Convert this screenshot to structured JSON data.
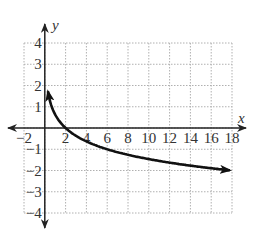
{
  "chart_data": {
    "type": "line",
    "title": "",
    "xlabel": "x",
    "ylabel": "y",
    "xlim": [
      -2,
      18
    ],
    "ylim": [
      -4,
      4
    ],
    "grid": true,
    "grid_style": "dotted",
    "x_ticks": [
      -2,
      2,
      4,
      6,
      8,
      10,
      12,
      14,
      16,
      18
    ],
    "x_tick_labels": [
      "−2",
      "2",
      "4",
      "6",
      "8",
      "10",
      "12",
      "14",
      "16",
      "18"
    ],
    "y_ticks": [
      4,
      3,
      2,
      1,
      -1,
      -2,
      -3,
      -4
    ],
    "y_tick_labels": [
      "4",
      "3",
      "2",
      "1",
      "−1",
      "−2",
      "−3",
      "−4"
    ],
    "series": [
      {
        "name": "curve",
        "description": "decreasing logarithmic curve, arrow heads at both ends, approx y = -log3(x/2)",
        "x": [
          0.3,
          0.5,
          1,
          2,
          4,
          6,
          8,
          10,
          12,
          14,
          16,
          18
        ],
        "y": [
          1.73,
          1.26,
          0.63,
          0,
          -0.63,
          -1.0,
          -1.26,
          -1.46,
          -1.63,
          -1.77,
          -1.89,
          -2.0
        ]
      }
    ]
  },
  "colors": {
    "axis": "#222222",
    "grid": "#b0b0b0",
    "curve": "#111111"
  }
}
